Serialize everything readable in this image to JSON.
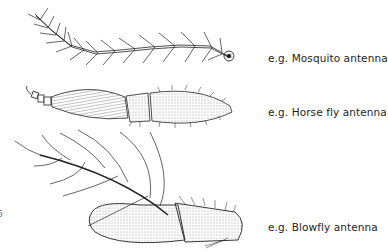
{
  "figure": {
    "type": "scientific-illustration",
    "items": [
      {
        "id": "mosquito",
        "label": "e.g. Mosquito antenna"
      },
      {
        "id": "horse-fly",
        "label": "e.g. Horse fly antenna"
      },
      {
        "id": "blowfly",
        "label": "e.g. Blowfly antenna"
      }
    ],
    "edge_mark": "6"
  }
}
